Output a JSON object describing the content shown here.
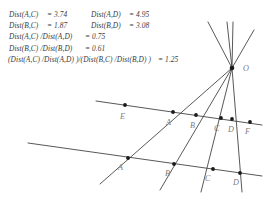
{
  "measurements": {
    "rows": [
      {
        "left_label": "Dist(A,C)",
        "left_eq": "= 3.74",
        "right_label": "Dist(A,D)",
        "right_eq": "= 4.95"
      },
      {
        "left_label": "Dist(B,C)",
        "left_eq": "= 1.87",
        "right_label": "Dist(B,D)",
        "right_eq": "= 3.08"
      }
    ],
    "ratio_rows": [
      {
        "label": "Dist(A,C) /Dist(A,D)",
        "eq": "= 0.75"
      },
      {
        "label": "Dist(B,C) /Dist(B,D)",
        "eq": "= 0.61"
      }
    ],
    "cross_ratio": {
      "label": "(Dist(A,C) /Dist(A,D)  )/(Dist(B,C) /Dist(B,D)  )",
      "eq": "= 1.25"
    }
  },
  "diagram": {
    "vertex_label": "O",
    "upper_line_labels": [
      "E",
      "A",
      "B",
      "C",
      "D",
      "F"
    ],
    "lower_line_labels": [
      "A",
      "B",
      "C",
      "D"
    ],
    "stroke_color": "#3a3a3a",
    "point_color": "#1a1a1a",
    "label_color": "#7d7d7d",
    "vertex": {
      "x": 232,
      "y": 68
    },
    "upper_points": [
      {
        "label": "E",
        "x": 125,
        "y": 105
      },
      {
        "label": "A",
        "x": 173,
        "y": 112
      },
      {
        "label": "B",
        "x": 196,
        "y": 115
      },
      {
        "label": "C",
        "x": 221,
        "y": 118
      },
      {
        "label": "D",
        "x": 232,
        "y": 119
      },
      {
        "label": "F",
        "x": 250,
        "y": 122
      }
    ],
    "lower_points": [
      {
        "label": "A",
        "x": 128,
        "y": 158
      },
      {
        "label": "B",
        "x": 174,
        "y": 164
      },
      {
        "label": "C",
        "x": 213,
        "y": 169
      },
      {
        "label": "D",
        "x": 240,
        "y": 173
      }
    ],
    "upper_transversal": {
      "x1": 96,
      "y1": 101,
      "x2": 262,
      "y2": 125
    },
    "lower_transversal": {
      "x1": 28,
      "y1": 143,
      "x2": 262,
      "y2": 176
    }
  }
}
